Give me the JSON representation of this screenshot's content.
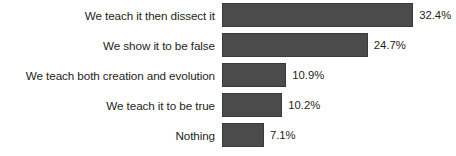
{
  "chart_data": {
    "type": "bar",
    "orientation": "horizontal",
    "title": "",
    "subtitle": "",
    "xlabel": "",
    "ylabel": "",
    "grid": false,
    "legend": false,
    "legend_position": "none",
    "axis_visible": false,
    "tick_labels": [],
    "xlim": [
      0,
      35
    ],
    "categories": [
      "We teach it then dissect it",
      "We show it to be false",
      "We teach both creation and evolution",
      "We teach it to be true",
      "Nothing"
    ],
    "values": [
      32.4,
      24.7,
      10.9,
      10.2,
      7.1
    ],
    "value_labels": [
      "32.4%",
      "24.7%",
      "10.9%",
      "10.2%",
      "7.1%"
    ],
    "bar_color": "#4b4b4b",
    "bar_border_color": "#3a3a3a",
    "text_color": "#231f20",
    "background_color": "#ffffff"
  }
}
